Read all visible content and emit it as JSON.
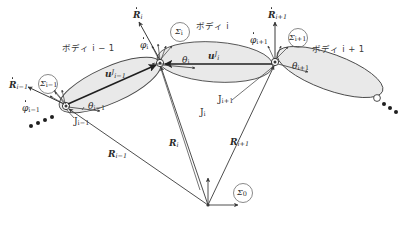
{
  "figure": {
    "type": "multibody-kinematics-diagram"
  },
  "bodies": [
    {
      "id": "i-1",
      "label": "ボディ i − 1"
    },
    {
      "id": "i",
      "label": "ボディ i"
    },
    {
      "id": "i+1",
      "label": "ボディ i + 1"
    }
  ],
  "frames": [
    {
      "id": "sigma-i-minus-1",
      "sym": "Σ",
      "sub": "i−1"
    },
    {
      "id": "sigma-i",
      "sym": "Σ",
      "sub": "i"
    },
    {
      "id": "sigma-i-plus-1",
      "sym": "Σ",
      "sub": "i+1"
    },
    {
      "id": "sigma-0",
      "sym": "Σ",
      "sub": "0"
    }
  ],
  "joints": [
    {
      "id": "joint-i-minus-1",
      "sym": "J",
      "sub": "i−1"
    },
    {
      "id": "joint-i",
      "sym": "J",
      "sub": "i"
    },
    {
      "id": "joint-i-plus-1",
      "sym": "J",
      "sub": "i+1"
    }
  ],
  "position_vectors": [
    {
      "id": "R-i-minus-1",
      "sym": "R",
      "sub": "i−1"
    },
    {
      "id": "R-i",
      "sym": "R",
      "sub": "i"
    },
    {
      "id": "R-i-plus-1",
      "sym": "R",
      "sub": "i+1"
    }
  ],
  "velocity_vectors": [
    {
      "id": "Rdot-i-minus-1",
      "sym": "R",
      "sub": "i−1",
      "accent": "dot"
    },
    {
      "id": "Rdot-i",
      "sym": "R",
      "sub": "i",
      "accent": "dot"
    },
    {
      "id": "Rdot-i-plus-1",
      "sym": "R",
      "sub": "i+1",
      "accent": "dot"
    }
  ],
  "joint_vectors": [
    {
      "id": "u-J-i-minus-1",
      "sym": "u",
      "sup": "J",
      "sub": "i−1"
    },
    {
      "id": "u-J-i",
      "sym": "u",
      "sup": "J",
      "sub": "i"
    }
  ],
  "angles": [
    {
      "id": "phidot-i-minus-1",
      "sym": "φ",
      "sub": "i−1",
      "accent": "dot"
    },
    {
      "id": "phidot-i",
      "sym": "φ",
      "sub": "i",
      "accent": "dot"
    },
    {
      "id": "phidot-i-plus-1",
      "sym": "φ",
      "sub": "i+1",
      "accent": "dot"
    },
    {
      "id": "theta-i-minus-1",
      "sym": "θ",
      "sub": "i−1"
    },
    {
      "id": "theta-i",
      "sym": "θ",
      "sub": "i"
    },
    {
      "id": "theta-i-plus-1",
      "sym": "θ",
      "sub": "i+1"
    }
  ],
  "colors": {
    "stroke": "#3a3a3a",
    "body_fill": "#e9e9e9",
    "body_stroke": "#4a4a4a",
    "text": "#2a2a2a",
    "background": "#ffffff"
  }
}
